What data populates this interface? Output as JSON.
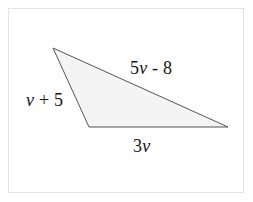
{
  "figure": {
    "kind": "geometry-diagram",
    "shape": "triangle",
    "background_color": "#ffffff",
    "border_color": "#e3e3e3",
    "fill_color": "#f4f4f4",
    "stroke_color": "#555555",
    "stroke_width": 1,
    "vertices": {
      "apex": {
        "x": 53,
        "y": 48
      },
      "bottom_left": {
        "x": 89,
        "y": 127
      },
      "bottom_right": {
        "x": 228,
        "y": 127
      }
    },
    "labels": {
      "hypotenuse": {
        "coefficient": "5",
        "variable": "v",
        "operator": " - ",
        "constant": "8",
        "text": "5v - 8",
        "position": "upper-right"
      },
      "left_side": {
        "variable": "v",
        "operator": " + ",
        "constant": "5",
        "text": "v + 5",
        "position": "left-outside"
      },
      "bottom_side": {
        "coefficient": "3",
        "variable": "v",
        "text": "3v",
        "position": "below-center"
      }
    }
  }
}
